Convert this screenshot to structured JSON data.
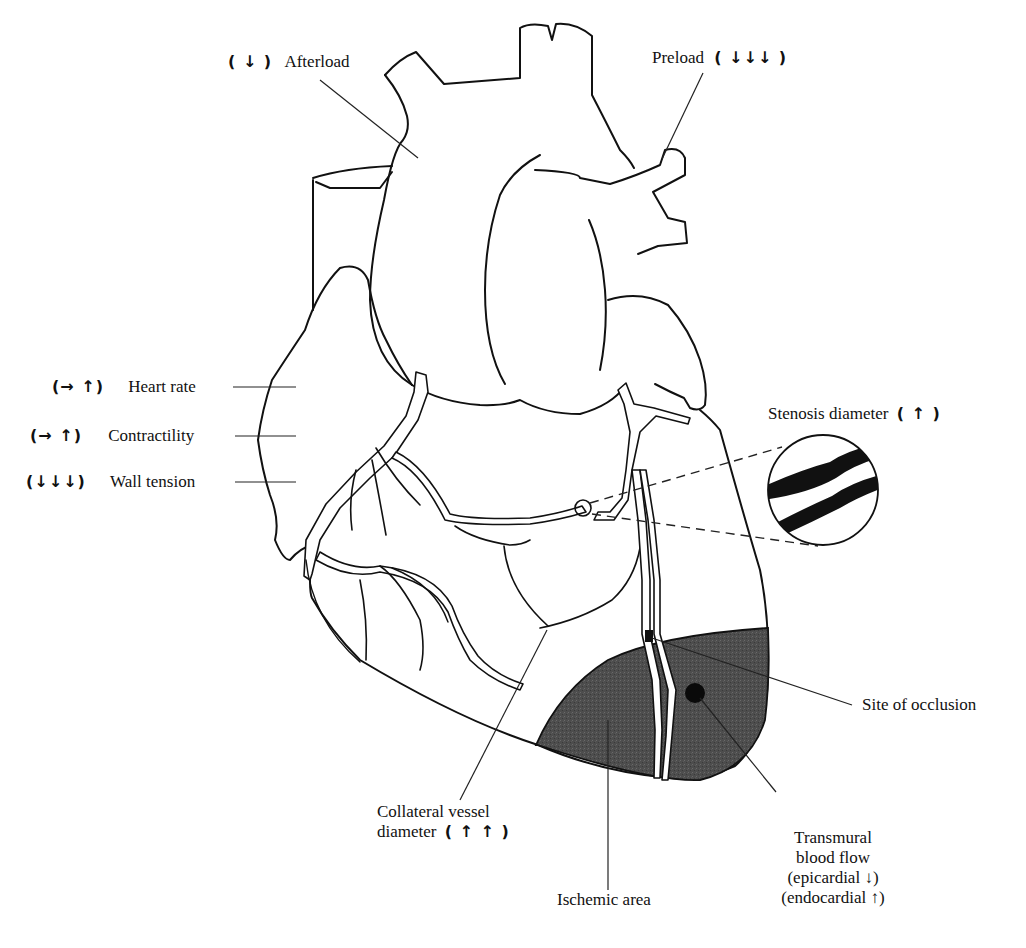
{
  "figure": {
    "colors": {
      "background": "#ffffff",
      "line": "#111111",
      "ischemic_fill": "#4a4a4a",
      "stenosis_fill": "#111111"
    }
  },
  "labels": {
    "afterload": {
      "arrows": "( ↓ )",
      "text": "Afterload"
    },
    "preload": {
      "text": "Preload",
      "arrows": "( ↓↓↓ )"
    },
    "heart_rate": {
      "arrows": "(→ ↑)",
      "text": "Heart rate"
    },
    "contractility": {
      "arrows": "(→ ↑)",
      "text": "Contractility"
    },
    "wall_tension": {
      "arrows": "(↓↓↓)",
      "text": "Wall tension"
    },
    "stenosis": {
      "text": "Stenosis diameter",
      "arrows": "( ↑ )"
    },
    "site_of_occlusion": {
      "text": "Site of occlusion"
    },
    "collateral": {
      "line1": "Collateral vessel",
      "line2": "diameter",
      "arrows": "( ↑ ↑ )"
    },
    "ischemic_area": {
      "text": "Ischemic area"
    },
    "transmural": {
      "line1": "Transmural",
      "line2": "blood flow",
      "line3": "(epicardial ↓)",
      "line4": "(endocardial ↑)"
    }
  }
}
